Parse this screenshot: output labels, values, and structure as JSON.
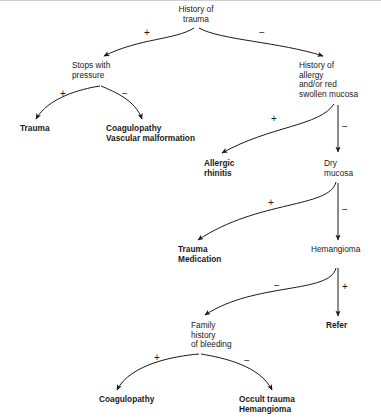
{
  "figure": {
    "type": "clinical-decision-flowchart",
    "background_color": "#ffffff",
    "line_color": "#1a1a1a",
    "text_color": "#1a1a1a"
  },
  "nodes": {
    "root": {
      "id": "history-of-trauma",
      "lines": [
        "History of",
        "trauma"
      ],
      "bold": false,
      "align": "middle",
      "x": 196,
      "y": 12
    },
    "stops_with_pressure": {
      "id": "stops-with-pressure",
      "lines": [
        "Stops with",
        "pressure"
      ],
      "bold": false,
      "align": "start",
      "x": 72,
      "y": 68
    },
    "history_allergy": {
      "id": "history-of-allergy",
      "lines": [
        "History of",
        "allergy",
        "and/or red",
        "swollen mucosa"
      ],
      "bold": false,
      "align": "start",
      "x": 299,
      "y": 68
    },
    "trauma_left": {
      "id": "trauma-outcome",
      "lines": [
        "Trauma"
      ],
      "bold": true,
      "align": "start",
      "x": 20,
      "y": 131
    },
    "coagulopathy_vascular": {
      "id": "coagulopathy-vascular-malformation",
      "lines": [
        "Coagulopathy",
        "Vascular malformation"
      ],
      "bold": true,
      "align": "start",
      "x": 106,
      "y": 131
    },
    "allergic_rhinitis": {
      "id": "allergic-rhinitis",
      "lines": [
        "Allergic",
        "rhinitis"
      ],
      "bold": true,
      "align": "start",
      "x": 204,
      "y": 166
    },
    "dry_mucosa": {
      "id": "dry-mucosa",
      "lines": [
        "Dry",
        "mucosa"
      ],
      "bold": false,
      "align": "start",
      "x": 324,
      "y": 166
    },
    "trauma_medication": {
      "id": "trauma-medication",
      "lines": [
        "Trauma",
        "Medication"
      ],
      "bold": true,
      "align": "start",
      "x": 178,
      "y": 252
    },
    "hemangioma": {
      "id": "hemangioma",
      "lines": [
        "Hemangioma"
      ],
      "bold": false,
      "align": "start",
      "x": 311,
      "y": 252
    },
    "family_history": {
      "id": "family-history-of-bleeding",
      "lines": [
        "Family",
        "history",
        "of bleeding"
      ],
      "bold": false,
      "align": "start",
      "x": 191,
      "y": 328
    },
    "refer": {
      "id": "refer",
      "lines": [
        "Refer"
      ],
      "bold": true,
      "align": "start",
      "x": 326,
      "y": 328
    },
    "coagulopathy_bottom": {
      "id": "coagulopathy-outcome",
      "lines": [
        "Coagulopathy"
      ],
      "bold": true,
      "align": "start",
      "x": 99,
      "y": 402
    },
    "occult_trauma": {
      "id": "occult-trauma-hemangioma",
      "lines": [
        "Occult trauma",
        "Hemangioma"
      ],
      "bold": true,
      "align": "start",
      "x": 239,
      "y": 402
    }
  },
  "edges": [
    {
      "id": "root-to-stops-with-pressure",
      "from": "history-of-trauma",
      "to": "stops-with-pressure",
      "sign": "+",
      "sign_x": 147,
      "sign_y": 36,
      "path": "M 194 28 C 175 40 140 38 104 56"
    },
    {
      "id": "root-to-history-of-allergy",
      "from": "history-of-trauma",
      "to": "history-of-allergy",
      "sign": "−",
      "sign_x": 262,
      "sign_y": 36,
      "path": "M 199 28 C 220 40 280 42 323 56"
    },
    {
      "id": "stops-to-trauma",
      "from": "stops-with-pressure",
      "to": "trauma-outcome",
      "sign": "+",
      "sign_x": 63,
      "sign_y": 97,
      "path": "M 100 86 C 80 89 48 98 36 119"
    },
    {
      "id": "stops-to-coagulopathy",
      "from": "stops-with-pressure",
      "to": "coagulopathy-vascular-malformation",
      "sign": "−",
      "sign_x": 125,
      "sign_y": 97,
      "path": "M 101 86 C 115 92 135 100 142 119"
    },
    {
      "id": "allergy-to-allergic-rhinitis",
      "from": "history-of-allergy",
      "to": "allergic-rhinitis",
      "sign": "+",
      "sign_x": 274,
      "sign_y": 122,
      "path": "M 334 104 C 320 126 270 126 222 153"
    },
    {
      "id": "allergy-to-dry-mucosa",
      "from": "history-of-allergy",
      "to": "dry-mucosa",
      "sign": "−",
      "sign_x": 345,
      "sign_y": 130,
      "path": "M 338 105 L 338 152"
    },
    {
      "id": "dry-mucosa-to-trauma-medication",
      "from": "dry-mucosa",
      "to": "trauma-medication",
      "sign": "+",
      "sign_x": 271,
      "sign_y": 206,
      "path": "M 336 182 C 330 208 258 200 198 240"
    },
    {
      "id": "dry-mucosa-to-hemangioma",
      "from": "dry-mucosa",
      "to": "hemangioma",
      "sign": "−",
      "sign_x": 345,
      "sign_y": 213,
      "path": "M 338 183 L 338 240"
    },
    {
      "id": "hemangioma-to-family-history",
      "from": "hemangioma",
      "to": "family-history-of-bleeding",
      "sign": "−",
      "sign_x": 277,
      "sign_y": 289,
      "path": "M 336 268 C 330 294 255 282 205 315"
    },
    {
      "id": "hemangioma-to-refer",
      "from": "hemangioma",
      "to": "refer",
      "sign": "+",
      "sign_x": 345,
      "sign_y": 290,
      "path": "M 338 268 L 338 316"
    },
    {
      "id": "family-history-to-coagulopathy",
      "from": "family-history-of-bleeding",
      "to": "coagulopathy-outcome",
      "sign": "+",
      "sign_x": 157,
      "sign_y": 361,
      "path": "M 199 354 C 175 356 130 364 117 390"
    },
    {
      "id": "family-history-to-occult-trauma",
      "from": "family-history-of-bleeding",
      "to": "occult-trauma-hemangioma",
      "sign": "−",
      "sign_x": 247,
      "sign_y": 364,
      "path": "M 201 354 C 225 358 260 366 272 390"
    }
  ]
}
